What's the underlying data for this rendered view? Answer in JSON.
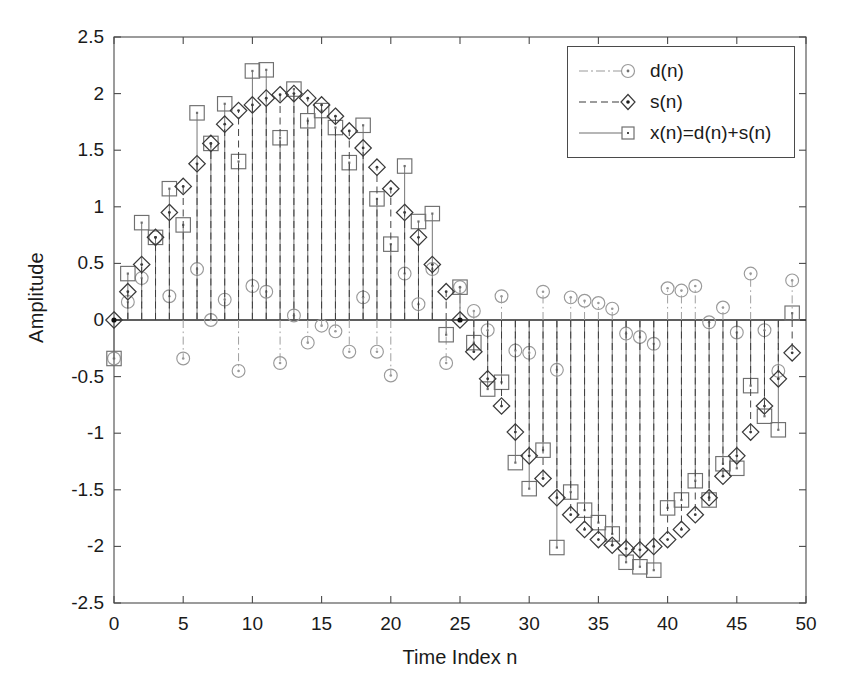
{
  "chart_data": {
    "type": "scatter",
    "title": "",
    "xlabel": "Time Index n",
    "ylabel": "Amplitude",
    "xlim": [
      0,
      50
    ],
    "ylim": [
      -2.5,
      2.5
    ],
    "xticks": [
      0,
      5,
      10,
      15,
      20,
      25,
      30,
      35,
      40,
      45,
      50
    ],
    "xtick_labels": [
      "0",
      "5",
      "10",
      "15",
      "20",
      "25",
      "30",
      "35",
      "40",
      "45",
      "50"
    ],
    "yticks": [
      -2.5,
      -2,
      -1.5,
      -1,
      -0.5,
      0,
      0.5,
      1,
      1.5,
      2,
      2.5
    ],
    "ytick_labels": [
      "-2.5",
      "-2",
      "-1.5",
      "-1",
      "-0.5",
      "0",
      "0.5",
      "1",
      "1.5",
      "2",
      "2.5"
    ],
    "grid": false,
    "legend_position": "upper right",
    "stem_plot": true,
    "baseline": 0,
    "x": [
      0,
      1,
      2,
      3,
      4,
      5,
      6,
      7,
      8,
      9,
      10,
      11,
      12,
      13,
      14,
      15,
      16,
      17,
      18,
      19,
      20,
      21,
      22,
      23,
      24,
      25,
      26,
      27,
      28,
      29,
      30,
      31,
      32,
      33,
      34,
      35,
      36,
      37,
      38,
      39,
      40,
      41,
      42,
      43,
      44,
      45,
      46,
      47,
      48,
      49
    ],
    "series": [
      {
        "name": "d(n)",
        "marker": "circle",
        "linestyle": "dashdot",
        "color": "#9a9a9a",
        "values": [
          -0.34,
          0.16,
          0.37,
          0.73,
          0.21,
          -0.34,
          0.45,
          0.0,
          0.18,
          -0.45,
          0.3,
          0.25,
          -0.38,
          0.04,
          -0.2,
          -0.05,
          -0.1,
          -0.28,
          0.2,
          -0.28,
          -0.49,
          0.41,
          0.14,
          0.45,
          -0.38,
          0.29,
          0.08,
          -0.09,
          0.21,
          -0.27,
          -0.29,
          0.25,
          -0.44,
          0.2,
          0.17,
          0.15,
          0.1,
          -0.12,
          -0.15,
          -0.21,
          0.28,
          0.26,
          0.3,
          -0.02,
          0.11,
          -0.11,
          0.41,
          -0.09,
          -0.45,
          0.35
        ]
      },
      {
        "name": "s(n)",
        "marker": "diamond",
        "linestyle": "dashed",
        "color": "#3a3a3a",
        "values": [
          0.0,
          0.25,
          0.49,
          0.73,
          0.95,
          1.18,
          1.38,
          1.56,
          1.73,
          1.85,
          1.9,
          1.96,
          1.99,
          2.0,
          1.96,
          1.9,
          1.8,
          1.67,
          1.52,
          1.35,
          1.16,
          0.95,
          0.73,
          0.49,
          0.25,
          0.0,
          -0.28,
          -0.52,
          -0.76,
          -0.99,
          -1.2,
          -1.4,
          -1.57,
          -1.72,
          -1.85,
          -1.94,
          -1.99,
          -2.02,
          -2.03,
          -2.0,
          -1.94,
          -1.85,
          -1.72,
          -1.57,
          -1.38,
          -1.2,
          -0.99,
          -0.76,
          -0.52,
          -0.29
        ]
      },
      {
        "name": "x(n)=d(n)+s(n)",
        "marker": "square",
        "linestyle": "solid",
        "color": "#6f6f6f",
        "values": [
          -0.34,
          0.41,
          0.86,
          0.73,
          1.16,
          0.84,
          1.83,
          1.56,
          1.91,
          1.4,
          2.2,
          2.21,
          1.61,
          2.04,
          1.76,
          1.85,
          1.7,
          1.39,
          1.72,
          1.07,
          0.67,
          1.36,
          0.87,
          0.94,
          -0.13,
          0.29,
          -0.2,
          -0.61,
          -0.55,
          -1.26,
          -1.49,
          -1.15,
          -2.01,
          -1.52,
          -1.68,
          -1.79,
          -1.89,
          -2.14,
          -2.18,
          -2.21,
          -1.66,
          -1.59,
          -1.42,
          -1.59,
          -1.27,
          -1.31,
          -0.58,
          -0.85,
          -0.97,
          0.06
        ]
      }
    ]
  },
  "legend": {
    "items": [
      {
        "label": "d(n)",
        "marker": "circle-icon",
        "color": "#9a9a9a"
      },
      {
        "label": "s(n)",
        "marker": "diamond-icon",
        "color": "#3a3a3a"
      },
      {
        "label": "x(n)=d(n)+s(n)",
        "marker": "square-icon",
        "color": "#6f6f6f"
      }
    ]
  },
  "axes": {
    "xlabel": "Time Index n",
    "ylabel": "Amplitude"
  }
}
